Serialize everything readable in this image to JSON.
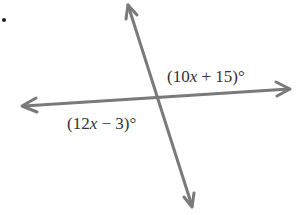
{
  "diagram": {
    "type": "intersecting-lines-vertical-angles",
    "line_color": "#7a7a7a",
    "label_color": "#333333",
    "labels": {
      "upper_right_angle": "(10x + 15)°",
      "lower_left_angle": "(12x − 3)°"
    },
    "upper_right_parts": {
      "open": "(10",
      "var": "x",
      "rest": " + 15)°"
    },
    "lower_left_parts": {
      "open": "(12",
      "var": "x",
      "rest": " − 3)°"
    }
  }
}
